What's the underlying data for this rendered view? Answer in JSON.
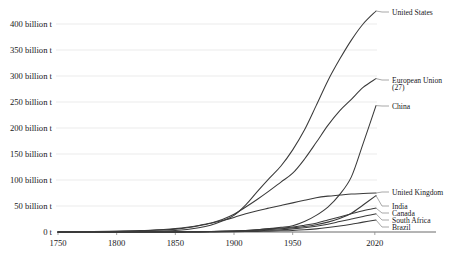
{
  "chart_data": {
    "type": "line",
    "title": "",
    "subtitle": "",
    "xlabel": "",
    "ylabel": "",
    "xlim": [
      1750,
      2021
    ],
    "ylim": [
      0,
      425
    ],
    "grid": true,
    "legend_position": "right-inline-labels",
    "unit": "billion t",
    "y_ticks": [
      0,
      50,
      100,
      150,
      200,
      250,
      300,
      350,
      400
    ],
    "y_tick_labels": [
      "0 t",
      "50 billion t",
      "100 billion t",
      "150 billion t",
      "200 billion t",
      "250 billion t",
      "300 billion t",
      "350 billion t",
      "400 billion t"
    ],
    "x_ticks": [
      1750,
      1800,
      1850,
      1900,
      1950,
      2020
    ],
    "x_tick_labels": [
      "1750",
      "1800",
      "1850",
      "1900",
      "1950",
      "2020"
    ],
    "x": [
      1750,
      1780,
      1800,
      1820,
      1840,
      1850,
      1860,
      1870,
      1880,
      1890,
      1900,
      1910,
      1920,
      1930,
      1940,
      1950,
      1960,
      1970,
      1980,
      1990,
      2000,
      2010,
      2021
    ],
    "series": [
      {
        "name": "United States",
        "label": "United States",
        "values": [
          0,
          0.1,
          0.3,
          0.8,
          2,
          3,
          5,
          8,
          13,
          21,
          32,
          52,
          78,
          103,
          127,
          158,
          196,
          243,
          291,
          332,
          369,
          400,
          425
        ],
        "end_value": 425
      },
      {
        "name": "European Union (27)",
        "label": "European Union (27)",
        "values": [
          0.2,
          0.6,
          1.2,
          2.3,
          4,
          5.5,
          8,
          12,
          17,
          24,
          34,
          48,
          63,
          79,
          96,
          113,
          140,
          172,
          205,
          233,
          255,
          278,
          295
        ],
        "end_value": 295
      },
      {
        "name": "China",
        "label": "China",
        "values": [
          0,
          0,
          0,
          0,
          0.1,
          0.2,
          0.3,
          0.5,
          0.8,
          1.2,
          2,
          3,
          4.5,
          6.5,
          9,
          12,
          20,
          32,
          48,
          72,
          106,
          170,
          243
        ],
        "end_value": 243
      },
      {
        "name": "United Kingdom",
        "label": "United Kingdom",
        "values": [
          0.2,
          0.7,
          1.5,
          2.8,
          5,
          6.5,
          9,
          12.5,
          17,
          22,
          28,
          35,
          41,
          46,
          51,
          56,
          61,
          66,
          69,
          71,
          73,
          74,
          75
        ],
        "end_value": 75
      },
      {
        "name": "India",
        "label": "India",
        "values": [
          0,
          0,
          0,
          0,
          0.1,
          0.2,
          0.3,
          0.5,
          0.8,
          1.2,
          1.8,
          2.6,
          3.6,
          4.8,
          6.2,
          8,
          10.5,
          14,
          19,
          26,
          36,
          52,
          70
        ],
        "end_value": 70
      },
      {
        "name": "Canada",
        "label": "Canada",
        "values": [
          0,
          0,
          0,
          0,
          0.1,
          0.2,
          0.3,
          0.5,
          0.8,
          1.3,
          2,
          3,
          4.5,
          6,
          7.5,
          9.5,
          13,
          17,
          23,
          29,
          35,
          41,
          46
        ],
        "end_value": 46
      },
      {
        "name": "South Africa",
        "label": "South Africa",
        "values": [
          0,
          0,
          0,
          0,
          0,
          0,
          0.1,
          0.2,
          0.3,
          0.6,
          1,
          1.6,
          2.4,
          3.4,
          4.5,
          6,
          8,
          11,
          15,
          20,
          25,
          30,
          35
        ],
        "end_value": 35
      },
      {
        "name": "Brazil",
        "label": "Brazil",
        "values": [
          0,
          0,
          0,
          0,
          0,
          0,
          0.1,
          0.1,
          0.2,
          0.3,
          0.5,
          0.8,
          1.2,
          1.7,
          2.3,
          3,
          4.2,
          6,
          8.5,
          11.5,
          15,
          19,
          23
        ],
        "end_value": 23
      }
    ]
  },
  "axis": {
    "y_labels": [
      {
        "text": "400 billion t",
        "value": 400
      },
      {
        "text": "350 billion t",
        "value": 350
      },
      {
        "text": "300 billion t",
        "value": 300
      },
      {
        "text": "250 billion t",
        "value": 250
      },
      {
        "text": "200 billion t",
        "value": 200
      },
      {
        "text": "150 billion t",
        "value": 150
      },
      {
        "text": "100 billion t",
        "value": 100
      },
      {
        "text": "50 billion t",
        "value": 50
      },
      {
        "text": "0 t",
        "value": 0
      }
    ],
    "x_labels": [
      "1750",
      "1800",
      "1850",
      "1900",
      "1950",
      "2020"
    ]
  }
}
